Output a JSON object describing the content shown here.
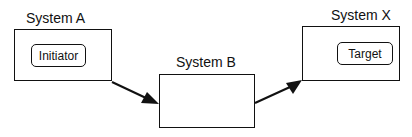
{
  "diagram": {
    "nodes": [
      {
        "id": "system_a",
        "label": "System A",
        "inner_label": "Initiator"
      },
      {
        "id": "system_b",
        "label": "System B",
        "inner_label": ""
      },
      {
        "id": "system_x",
        "label": "System X",
        "inner_label": "Target"
      }
    ],
    "edges": [
      {
        "from": "system_a",
        "to": "system_b"
      },
      {
        "from": "system_b",
        "to": "system_x"
      }
    ]
  }
}
